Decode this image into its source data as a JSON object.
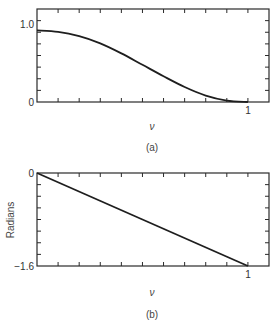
{
  "figure": {
    "panel_a_caption": "(a)",
    "panel_b_caption": "(b)"
  },
  "chart_data": [
    {
      "type": "line",
      "panel": "(a)",
      "title": "",
      "xlabel": "ν",
      "ylabel": "",
      "xlim": [
        0,
        1.1
      ],
      "ylim": [
        0,
        1.3
      ],
      "x_tick_labels": [
        "1"
      ],
      "y_tick_labels": [
        "0",
        "1.0"
      ],
      "grid": false,
      "series": [
        {
          "name": "magnitude",
          "x": [
            0,
            0.1,
            0.2,
            0.3,
            0.4,
            0.5,
            0.6,
            0.7,
            0.8,
            0.9,
            1.0
          ],
          "values": [
            1.0,
            0.98,
            0.92,
            0.82,
            0.68,
            0.52,
            0.36,
            0.21,
            0.09,
            0.02,
            0.0
          ]
        }
      ]
    },
    {
      "type": "line",
      "panel": "(b)",
      "title": "",
      "xlabel": "ν",
      "ylabel": "Radians",
      "xlim": [
        0,
        1.1
      ],
      "ylim": [
        -1.6,
        0
      ],
      "x_tick_labels": [
        "1"
      ],
      "y_tick_labels": [
        "0",
        "-1.6"
      ],
      "grid": false,
      "series": [
        {
          "name": "phase",
          "x": [
            0,
            1.0
          ],
          "values": [
            0,
            -1.6
          ]
        }
      ]
    }
  ],
  "labels": {
    "a_y_top": "1.0",
    "a_y_bottom": "0",
    "a_x_one": "1",
    "a_xlabel": "ν",
    "b_y_top": "0",
    "b_y_bottom": "−1.6",
    "b_x_one": "1",
    "b_xlabel": "ν",
    "b_ylabel": "Radians"
  }
}
